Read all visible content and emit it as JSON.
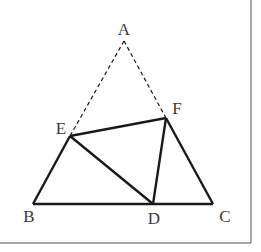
{
  "figure": {
    "type": "geometry",
    "frame": {
      "right_x": 251,
      "bottom_y": 243,
      "color": "#8a8a8a"
    },
    "points": {
      "A": {
        "x": 124,
        "y": 41,
        "label": "A",
        "lx": 124,
        "ly": 35
      },
      "E": {
        "x": 70,
        "y": 136,
        "label": "E",
        "lx": 61,
        "ly": 134
      },
      "F": {
        "x": 166,
        "y": 118,
        "label": "F",
        "lx": 177,
        "ly": 114
      },
      "B": {
        "x": 33,
        "y": 204,
        "label": "B",
        "lx": 29,
        "ly": 222
      },
      "D": {
        "x": 153,
        "y": 204,
        "label": "D",
        "lx": 154,
        "ly": 224
      },
      "C": {
        "x": 213,
        "y": 204,
        "label": "C",
        "lx": 225,
        "ly": 222
      }
    },
    "solid_segments": [
      "BC",
      "BE",
      "CF",
      "EF",
      "ED",
      "FD"
    ],
    "dashed_segments": [
      "AE",
      "AF"
    ],
    "line_color": "#1a1a1a"
  }
}
